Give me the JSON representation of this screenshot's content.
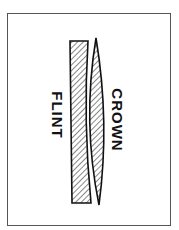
{
  "diagram": {
    "labels": {
      "flint": "FLINT",
      "crown": "CROWN"
    },
    "colors": {
      "stroke": "#111111",
      "hatch": "#222222",
      "frame": "#555555",
      "background": "#ffffff"
    },
    "elements": [
      {
        "name": "flint",
        "shape": "plano-concave",
        "fill": "hatched"
      },
      {
        "name": "crown",
        "shape": "biconvex",
        "fill": "hatched"
      }
    ]
  }
}
